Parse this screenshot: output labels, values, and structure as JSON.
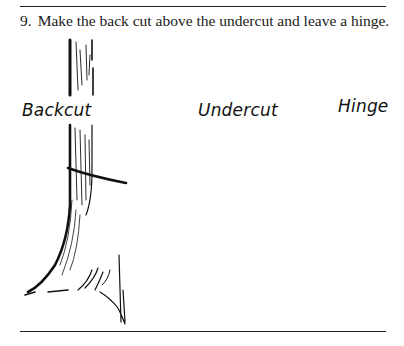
{
  "step": {
    "number": "9.",
    "text": "Make the back cut above the undercut and leave a hinge."
  },
  "figure": {
    "labels": {
      "backcut": "Backcut",
      "undercut": "Undercut",
      "hinge": "Hinge"
    },
    "panels": [
      {
        "name": "tree-with-backcut",
        "label": "Backcut"
      },
      {
        "name": "tree-with-undercut",
        "label": "Undercut"
      },
      {
        "name": "stump-cross-section-with-saw",
        "label": "Hinge"
      }
    ]
  },
  "colors": {
    "ink": "#111111",
    "background": "#ffffff",
    "rule": "#222222"
  }
}
